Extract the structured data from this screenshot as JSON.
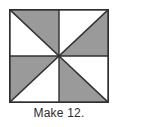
{
  "figure": {
    "name": "pinwheel-block-diagram",
    "caption": "Make 12.",
    "colors": {
      "shaded": "#9a9a9a",
      "unshaded": "#ffffff",
      "outline": "#2f2f2f",
      "background": "#ffffff",
      "caption_text": "#2b2b2b"
    },
    "block": {
      "shape": "square",
      "grid": "2x2",
      "unit": "half-square-triangle",
      "pattern": "pinwheel",
      "quadrants": [
        {
          "position": "top-left",
          "diagonal": "top-left-to-bottom-right",
          "shaded_half": "upper-right",
          "unshaded_half": "lower-left"
        },
        {
          "position": "top-right",
          "diagonal": "top-right-to-bottom-left",
          "shaded_half": "lower-right",
          "unshaded_half": "upper-left"
        },
        {
          "position": "bottom-left",
          "diagonal": "top-right-to-bottom-left",
          "shaded_half": "upper-left",
          "unshaded_half": "lower-right"
        },
        {
          "position": "bottom-right",
          "diagonal": "top-left-to-bottom-right",
          "shaded_half": "lower-left",
          "unshaded_half": "upper-right"
        }
      ]
    }
  }
}
